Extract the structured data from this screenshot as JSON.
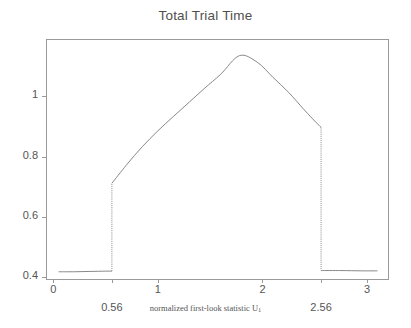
{
  "chart_data": {
    "type": "line",
    "title": "Total Trial Time",
    "xlabel": "normalized first-look statistic U",
    "xlabel_sub": "1",
    "ylabel": "",
    "xlim": [
      -0.07,
      3.2
    ],
    "ylim": [
      0.395,
      1.19
    ],
    "grid": false,
    "legend": null,
    "xticks": [
      {
        "value": 0,
        "label": "0",
        "row": 1
      },
      {
        "value": 0.56,
        "label": "0.56",
        "row": 2
      },
      {
        "value": 1,
        "label": "1",
        "row": 1
      },
      {
        "value": 2,
        "label": "2",
        "row": 1
      },
      {
        "value": 2.56,
        "label": "2.56",
        "row": 2
      },
      {
        "value": 3,
        "label": "3",
        "row": 1
      }
    ],
    "yticks": [
      {
        "value": 0.4,
        "label": "0.4"
      },
      {
        "value": 0.6,
        "label": "0.6"
      },
      {
        "value": 0.8,
        "label": "0.8"
      },
      {
        "value": 1.0,
        "label": "1"
      }
    ],
    "series": [
      {
        "name": "total trial time",
        "color": "#7a7a7a",
        "segments": [
          {
            "name": "left-plateau",
            "style": "solid",
            "x": [
              0.05,
              0.2,
              0.35,
              0.5,
              0.56
            ],
            "y": [
              0.419,
              0.419,
              0.42,
              0.421,
              0.421
            ]
          },
          {
            "name": "left-jump",
            "style": "dotted",
            "x": [
              0.56,
              0.56
            ],
            "y": [
              0.421,
              0.712
            ]
          },
          {
            "name": "main-arc",
            "style": "solid",
            "x": [
              0.56,
              0.7,
              0.85,
              1.0,
              1.15,
              1.3,
              1.45,
              1.6,
              1.78,
              1.95,
              2.1,
              2.25,
              2.4,
              2.5,
              2.56
            ],
            "y": [
              0.712,
              0.773,
              0.833,
              0.886,
              0.934,
              0.981,
              1.028,
              1.073,
              1.135,
              1.113,
              1.063,
              1.013,
              0.955,
              0.918,
              0.897
            ]
          },
          {
            "name": "right-drop",
            "style": "dotted",
            "x": [
              2.56,
              2.56
            ],
            "y": [
              0.897,
              0.423
            ]
          },
          {
            "name": "right-plateau",
            "style": "solid",
            "x": [
              2.56,
              2.75,
              2.95,
              3.1
            ],
            "y": [
              0.423,
              0.423,
              0.422,
              0.422
            ]
          }
        ]
      }
    ],
    "annotations": []
  },
  "colors": {
    "background": "#ffffff",
    "axis": "#9a9a9a",
    "text": "#555555",
    "title_text": "#4f4f4f",
    "curve": "#7a7a7a"
  },
  "plot_frame": {
    "left": 46,
    "top": 39,
    "right": 388,
    "bottom": 279
  }
}
